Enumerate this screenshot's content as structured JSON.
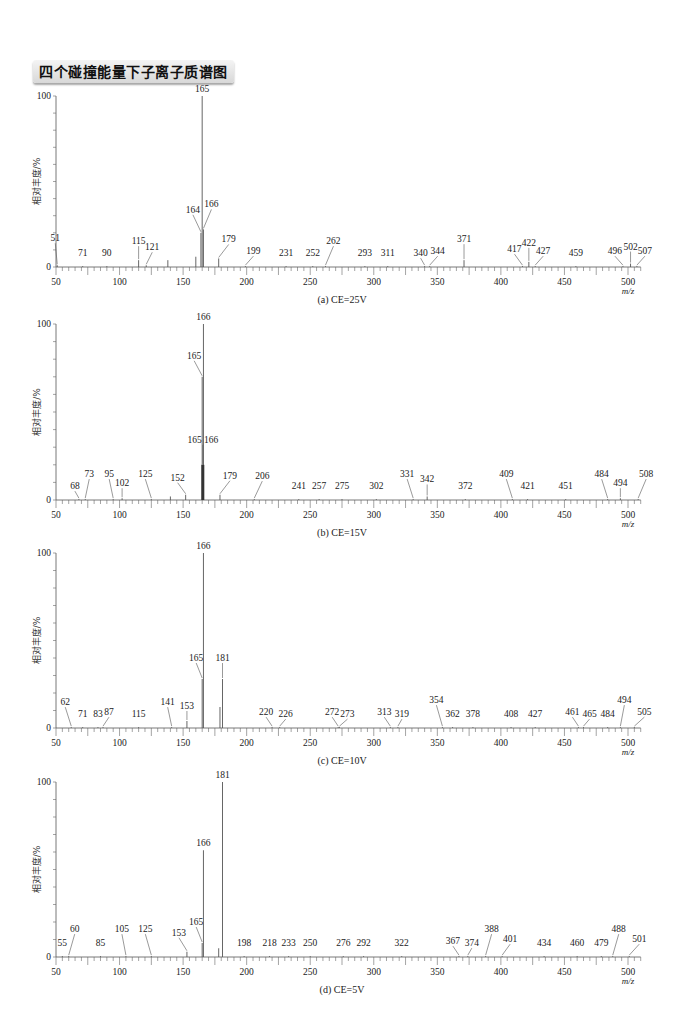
{
  "title": "四个碰撞能量下子离子质谱图",
  "chart_data": [
    {
      "type": "bar",
      "panel": "a",
      "caption": "(a) CE=25V",
      "title": "(a) CE=25V",
      "xlabel": "m/z",
      "ylabel": "相对丰度/%",
      "xlim": [
        50,
        510
      ],
      "ylim": [
        0,
        100
      ],
      "xticks": [
        50,
        100,
        150,
        200,
        250,
        300,
        350,
        400,
        450,
        500
      ],
      "yticks": [
        0,
        100
      ],
      "grid": false,
      "peaks": [
        {
          "mz": 51,
          "intensity": 1,
          "label": "51",
          "lx": -2,
          "ly": 20
        },
        {
          "mz": 71,
          "intensity": 0.5,
          "label": "71",
          "lx": 0,
          "ly": 6
        },
        {
          "mz": 90,
          "intensity": 0.5,
          "label": "90",
          "lx": 0,
          "ly": 6
        },
        {
          "mz": 115,
          "intensity": 4,
          "label": "115",
          "lx": 0,
          "ly": 12
        },
        {
          "mz": 121,
          "intensity": 1,
          "label": "121",
          "lx": 6,
          "ly": 11
        },
        {
          "mz": 138,
          "intensity": 4,
          "label": "",
          "lx": 0,
          "ly": 0
        },
        {
          "mz": 160,
          "intensity": 6,
          "label": "",
          "lx": 0,
          "ly": 0
        },
        {
          "mz": 164,
          "intensity": 20,
          "label": "164",
          "lx": -8,
          "ly": 16
        },
        {
          "mz": 165,
          "intensity": 100,
          "label": "165",
          "lx": 0,
          "ly": 0
        },
        {
          "mz": 166,
          "intensity": 22,
          "label": "166",
          "lx": 8,
          "ly": 18
        },
        {
          "mz": 178,
          "intensity": 5,
          "label": "179",
          "lx": 10,
          "ly": 12
        },
        {
          "mz": 199,
          "intensity": 0.5,
          "label": "199",
          "lx": 8,
          "ly": 8
        },
        {
          "mz": 231,
          "intensity": 0.5,
          "label": "231",
          "lx": 0,
          "ly": 6
        },
        {
          "mz": 252,
          "intensity": 0.5,
          "label": "252",
          "lx": 0,
          "ly": 6
        },
        {
          "mz": 262,
          "intensity": 0.5,
          "label": "262",
          "lx": 8,
          "ly": 18
        },
        {
          "mz": 293,
          "intensity": 0.5,
          "label": "293",
          "lx": 0,
          "ly": 6
        },
        {
          "mz": 311,
          "intensity": 0.5,
          "label": "311",
          "lx": 0,
          "ly": 6
        },
        {
          "mz": 340,
          "intensity": 0.5,
          "label": "340",
          "lx": -4,
          "ly": 6
        },
        {
          "mz": 344,
          "intensity": 0.5,
          "label": "344",
          "lx": 8,
          "ly": 8
        },
        {
          "mz": 371,
          "intensity": 4,
          "label": "371",
          "lx": 0,
          "ly": 14
        },
        {
          "mz": 417,
          "intensity": 0.5,
          "label": "417",
          "lx": -8,
          "ly": 10
        },
        {
          "mz": 422,
          "intensity": 3,
          "label": "422",
          "lx": 0,
          "ly": 12
        },
        {
          "mz": 427,
          "intensity": 0.5,
          "label": "427",
          "lx": 8,
          "ly": 8
        },
        {
          "mz": 459,
          "intensity": 0.5,
          "label": "459",
          "lx": 0,
          "ly": 6
        },
        {
          "mz": 496,
          "intensity": 0.5,
          "label": "496",
          "lx": -8,
          "ly": 8
        },
        {
          "mz": 502,
          "intensity": 2,
          "label": "502",
          "lx": 0,
          "ly": 10
        },
        {
          "mz": 507,
          "intensity": 0.5,
          "label": "507",
          "lx": 8,
          "ly": 8
        }
      ]
    },
    {
      "type": "bar",
      "panel": "b",
      "caption": "(b) CE=15V",
      "title": "(b) CE=15V",
      "xlabel": "m/z",
      "ylabel": "相对丰度/%",
      "xlim": [
        50,
        510
      ],
      "ylim": [
        0,
        100
      ],
      "xticks": [
        50,
        100,
        150,
        200,
        250,
        300,
        350,
        400,
        450,
        500
      ],
      "yticks": [
        0,
        100
      ],
      "grid": false,
      "peaks": [
        {
          "mz": 68,
          "intensity": 0.5,
          "label": "68",
          "lx": -4,
          "ly": 6
        },
        {
          "mz": 73,
          "intensity": 0.5,
          "label": "73",
          "lx": 4,
          "ly": 18
        },
        {
          "mz": 95,
          "intensity": 0.5,
          "label": "95",
          "lx": -4,
          "ly": 18
        },
        {
          "mz": 102,
          "intensity": 1,
          "label": "102",
          "lx": 0,
          "ly": 8
        },
        {
          "mz": 125,
          "intensity": 0.5,
          "label": "125",
          "lx": -6,
          "ly": 18
        },
        {
          "mz": 140,
          "intensity": 2,
          "label": "",
          "lx": 0,
          "ly": 0
        },
        {
          "mz": 152,
          "intensity": 3,
          "label": "152",
          "lx": -8,
          "ly": 10
        },
        {
          "mz": 165,
          "intensity": 70,
          "label": "165",
          "lx": -8,
          "ly": 14
        },
        {
          "mz": 166,
          "intensity": 100,
          "label": "166",
          "lx": 0,
          "ly": 0
        },
        {
          "mz": 165.5,
          "intensity": 20,
          "label": "165 166",
          "lx": 0,
          "ly": 18
        },
        {
          "mz": 179,
          "intensity": 3,
          "label": "179",
          "lx": 10,
          "ly": 12
        },
        {
          "mz": 206,
          "intensity": 0.5,
          "label": "206",
          "lx": 8,
          "ly": 16
        },
        {
          "mz": 241,
          "intensity": 0.5,
          "label": "241",
          "lx": 0,
          "ly": 6
        },
        {
          "mz": 257,
          "intensity": 0.5,
          "label": "257",
          "lx": 0,
          "ly": 6
        },
        {
          "mz": 275,
          "intensity": 0.5,
          "label": "275",
          "lx": 0,
          "ly": 6
        },
        {
          "mz": 302,
          "intensity": 0.5,
          "label": "302",
          "lx": 0,
          "ly": 6
        },
        {
          "mz": 331,
          "intensity": 0.5,
          "label": "331",
          "lx": -6,
          "ly": 18
        },
        {
          "mz": 342,
          "intensity": 2,
          "label": "342",
          "lx": 0,
          "ly": 10
        },
        {
          "mz": 372,
          "intensity": 0.5,
          "label": "372",
          "lx": 0,
          "ly": 6
        },
        {
          "mz": 409,
          "intensity": 0.5,
          "label": "409",
          "lx": -6,
          "ly": 18
        },
        {
          "mz": 421,
          "intensity": 0.5,
          "label": "421",
          "lx": 0,
          "ly": 6
        },
        {
          "mz": 451,
          "intensity": 0.5,
          "label": "451",
          "lx": 0,
          "ly": 6
        },
        {
          "mz": 484,
          "intensity": 0.5,
          "label": "484",
          "lx": -6,
          "ly": 18
        },
        {
          "mz": 494,
          "intensity": 1,
          "label": "494",
          "lx": 0,
          "ly": 8
        },
        {
          "mz": 508,
          "intensity": 0.5,
          "label": "508",
          "lx": 8,
          "ly": 18
        }
      ]
    },
    {
      "type": "bar",
      "panel": "c",
      "caption": "(c) CE=10V",
      "title": "(c) CE=10V",
      "xlabel": "m/z",
      "ylabel": "相对丰度/%",
      "xlim": [
        50,
        510
      ],
      "ylim": [
        0,
        100
      ],
      "xticks": [
        50,
        100,
        150,
        200,
        250,
        300,
        350,
        400,
        450,
        500
      ],
      "yticks": [
        0,
        100
      ],
      "grid": false,
      "peaks": [
        {
          "mz": 62,
          "intensity": 0.5,
          "label": "62",
          "lx": -6,
          "ly": 18
        },
        {
          "mz": 71,
          "intensity": 0.5,
          "label": "71",
          "lx": 0,
          "ly": 6
        },
        {
          "mz": 83,
          "intensity": 0.5,
          "label": "83",
          "lx": 0,
          "ly": 6
        },
        {
          "mz": 87,
          "intensity": 0.5,
          "label": "87",
          "lx": 6,
          "ly": 8
        },
        {
          "mz": 115,
          "intensity": 0.5,
          "label": "115",
          "lx": 0,
          "ly": 6
        },
        {
          "mz": 141,
          "intensity": 0.5,
          "label": "141",
          "lx": -4,
          "ly": 18
        },
        {
          "mz": 153,
          "intensity": 4,
          "label": "153",
          "lx": 0,
          "ly": 8
        },
        {
          "mz": 165,
          "intensity": 28,
          "label": "165",
          "lx": -6,
          "ly": 14
        },
        {
          "mz": 166,
          "intensity": 100,
          "label": "166",
          "lx": 0,
          "ly": 0
        },
        {
          "mz": 179,
          "intensity": 12,
          "label": "",
          "lx": 0,
          "ly": 0
        },
        {
          "mz": 181,
          "intensity": 28,
          "label": "181",
          "lx": 0,
          "ly": 14
        },
        {
          "mz": 220,
          "intensity": 0.5,
          "label": "220",
          "lx": -6,
          "ly": 8
        },
        {
          "mz": 226,
          "intensity": 0.5,
          "label": "226",
          "lx": 6,
          "ly": 6
        },
        {
          "mz": 272,
          "intensity": 0.5,
          "label": "272",
          "lx": -6,
          "ly": 8
        },
        {
          "mz": 273,
          "intensity": 0.5,
          "label": "273",
          "lx": 8,
          "ly": 6
        },
        {
          "mz": 313,
          "intensity": 0.5,
          "label": "313",
          "lx": -6,
          "ly": 8
        },
        {
          "mz": 319,
          "intensity": 0.5,
          "label": "319",
          "lx": 4,
          "ly": 6
        },
        {
          "mz": 354,
          "intensity": 0.5,
          "label": "354",
          "lx": -6,
          "ly": 20
        },
        {
          "mz": 362,
          "intensity": 0.5,
          "label": "362",
          "lx": 0,
          "ly": 6
        },
        {
          "mz": 378,
          "intensity": 0.5,
          "label": "378",
          "lx": 0,
          "ly": 6
        },
        {
          "mz": 408,
          "intensity": 0.5,
          "label": "408",
          "lx": 0,
          "ly": 6
        },
        {
          "mz": 427,
          "intensity": 0.5,
          "label": "427",
          "lx": 0,
          "ly": 6
        },
        {
          "mz": 461,
          "intensity": 0.5,
          "label": "461",
          "lx": -6,
          "ly": 8
        },
        {
          "mz": 465,
          "intensity": 0.5,
          "label": "465",
          "lx": 6,
          "ly": 6
        },
        {
          "mz": 484,
          "intensity": 0.5,
          "label": "484",
          "lx": 0,
          "ly": 6
        },
        {
          "mz": 494,
          "intensity": 0.5,
          "label": "494",
          "lx": 4,
          "ly": 20
        },
        {
          "mz": 505,
          "intensity": 0.5,
          "label": "505",
          "lx": 10,
          "ly": 8
        }
      ]
    },
    {
      "type": "bar",
      "panel": "d",
      "caption": "(d) CE=5V",
      "title": "(d) CE=5V",
      "xlabel": "m/z",
      "ylabel": "相对丰度/%",
      "xlim": [
        50,
        510
      ],
      "ylim": [
        0,
        100
      ],
      "xticks": [
        50,
        100,
        150,
        200,
        250,
        300,
        350,
        400,
        450,
        500
      ],
      "yticks": [
        0,
        100
      ],
      "grid": false,
      "peaks": [
        {
          "mz": 55,
          "intensity": 0.5,
          "label": "55",
          "lx": 0,
          "ly": 6
        },
        {
          "mz": 60,
          "intensity": 0.5,
          "label": "60",
          "lx": 6,
          "ly": 20
        },
        {
          "mz": 85,
          "intensity": 0.5,
          "label": "85",
          "lx": 0,
          "ly": 6
        },
        {
          "mz": 105,
          "intensity": 0.5,
          "label": "105",
          "lx": -4,
          "ly": 20
        },
        {
          "mz": 125,
          "intensity": 0.5,
          "label": "125",
          "lx": -6,
          "ly": 20
        },
        {
          "mz": 153,
          "intensity": 3,
          "label": "153",
          "lx": -8,
          "ly": 12
        },
        {
          "mz": 165,
          "intensity": 8,
          "label": "165",
          "lx": -6,
          "ly": 14
        },
        {
          "mz": 166,
          "intensity": 61,
          "label": "166",
          "lx": 0,
          "ly": 0
        },
        {
          "mz": 178,
          "intensity": 5,
          "label": "",
          "lx": 0,
          "ly": 0
        },
        {
          "mz": 181,
          "intensity": 100,
          "label": "181",
          "lx": 0,
          "ly": 0
        },
        {
          "mz": 198,
          "intensity": 0.5,
          "label": "198",
          "lx": 0,
          "ly": 6
        },
        {
          "mz": 218,
          "intensity": 0.5,
          "label": "218",
          "lx": 0,
          "ly": 6
        },
        {
          "mz": 233,
          "intensity": 0.5,
          "label": "233",
          "lx": 0,
          "ly": 6
        },
        {
          "mz": 250,
          "intensity": 0.5,
          "label": "250",
          "lx": 0,
          "ly": 6
        },
        {
          "mz": 276,
          "intensity": 0.5,
          "label": "276",
          "lx": 0,
          "ly": 6
        },
        {
          "mz": 292,
          "intensity": 0.5,
          "label": "292",
          "lx": 0,
          "ly": 6
        },
        {
          "mz": 322,
          "intensity": 0.5,
          "label": "322",
          "lx": 0,
          "ly": 6
        },
        {
          "mz": 367,
          "intensity": 0.5,
          "label": "367",
          "lx": -6,
          "ly": 8
        },
        {
          "mz": 374,
          "intensity": 0.5,
          "label": "374",
          "lx": 4,
          "ly": 6
        },
        {
          "mz": 388,
          "intensity": 0.5,
          "label": "388",
          "lx": 6,
          "ly": 20
        },
        {
          "mz": 401,
          "intensity": 0.5,
          "label": "401",
          "lx": 8,
          "ly": 10
        },
        {
          "mz": 434,
          "intensity": 0.5,
          "label": "434",
          "lx": 0,
          "ly": 6
        },
        {
          "mz": 460,
          "intensity": 0.5,
          "label": "460",
          "lx": 0,
          "ly": 6
        },
        {
          "mz": 479,
          "intensity": 0.5,
          "label": "479",
          "lx": 0,
          "ly": 6
        },
        {
          "mz": 488,
          "intensity": 0.5,
          "label": "488",
          "lx": 6,
          "ly": 20
        },
        {
          "mz": 501,
          "intensity": 0.5,
          "label": "501",
          "lx": 10,
          "ly": 10
        }
      ]
    }
  ],
  "layout": {
    "panels_top100": [
      96,
      324,
      553,
      782
    ],
    "panels_zero": [
      267,
      500,
      728,
      957
    ],
    "x50": 56,
    "x500": 628
  }
}
